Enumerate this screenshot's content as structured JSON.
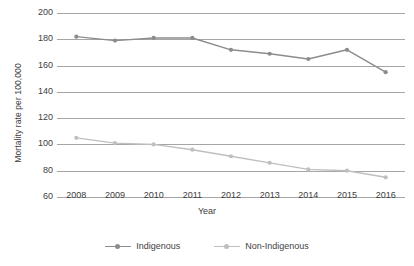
{
  "chart_data": {
    "type": "line",
    "title": "",
    "xlabel": "Year",
    "ylabel": "Mortality rate per 100,000",
    "categories": [
      "2008",
      "2009",
      "2010",
      "2011",
      "2012",
      "2013",
      "2014",
      "2015",
      "2016"
    ],
    "x": [
      2008,
      2009,
      2010,
      2011,
      2012,
      2013,
      2014,
      2015,
      2016
    ],
    "ylim": [
      60,
      200
    ],
    "yticks": [
      60,
      80,
      100,
      120,
      140,
      160,
      180,
      200
    ],
    "ytick_labels": [
      "60",
      "80",
      "100",
      "120",
      "140",
      "160",
      "180",
      "200"
    ],
    "grid": "horizontal",
    "legend_position": "bottom-center",
    "series": [
      {
        "name": "Indigenous",
        "color": "#8c8c8c",
        "marker": "circle",
        "values": [
          182,
          179,
          181,
          181,
          172,
          169,
          165,
          172,
          155
        ]
      },
      {
        "name": "Non-Indigenous",
        "color": "#bfbfbf",
        "marker": "circle",
        "values": [
          105,
          101,
          100,
          96,
          91,
          86,
          81,
          80,
          75
        ]
      }
    ]
  },
  "legend": {
    "items": [
      {
        "label": "Indigenous"
      },
      {
        "label": "Non-Indigenous"
      }
    ]
  },
  "colors": {
    "gridline": "#a6a6a6",
    "text": "#404040",
    "background": "#ffffff"
  }
}
